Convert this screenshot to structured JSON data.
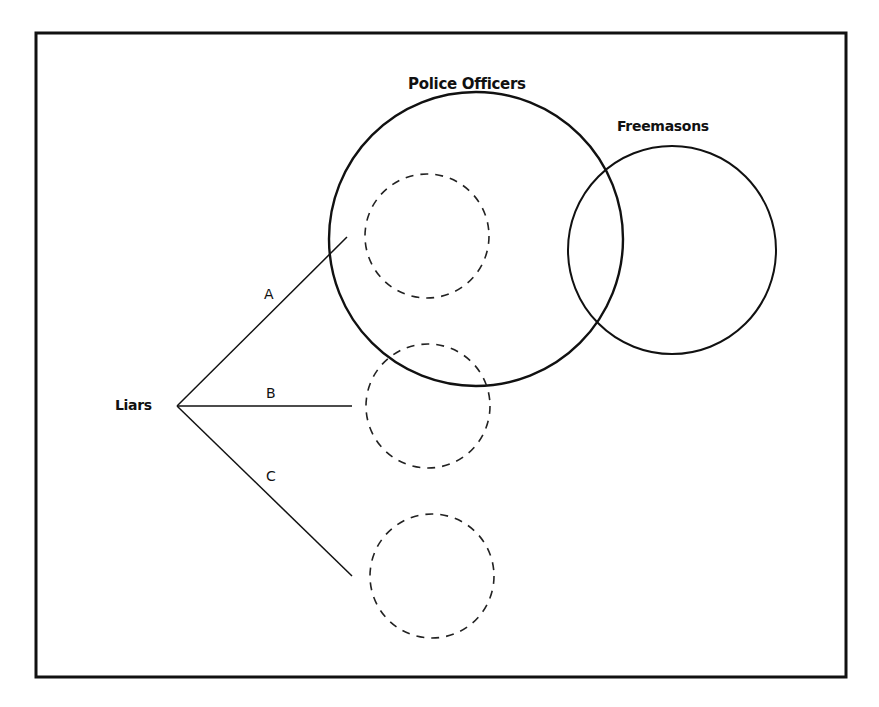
{
  "diagram": {
    "type": "venn-with-branches",
    "frame": {
      "x": 36,
      "y": 33,
      "width": 810,
      "height": 644,
      "stroke": "#111111"
    },
    "sets": [
      {
        "id": "police",
        "label": "Police Officers",
        "cx": 476,
        "cy": 239,
        "r": 147,
        "style": "solid"
      },
      {
        "id": "freemasons",
        "label": "Freemasons",
        "cx": 672,
        "cy": 250,
        "r": 104,
        "style": "solid"
      }
    ],
    "hypothetical_sets": [
      {
        "id": "liars-a",
        "cx": 427,
        "cy": 236,
        "r": 62,
        "style": "dashed"
      },
      {
        "id": "liars-b",
        "cx": 428,
        "cy": 406,
        "r": 62,
        "style": "dashed"
      },
      {
        "id": "liars-c",
        "cx": 432,
        "cy": 576,
        "r": 62,
        "style": "dashed"
      }
    ],
    "origin": {
      "label": "Liars",
      "x": 177,
      "y": 406
    },
    "branches": [
      {
        "label": "A",
        "x2": 347,
        "y2": 237
      },
      {
        "label": "B",
        "x2": 352,
        "y2": 406
      },
      {
        "label": "C",
        "x2": 352,
        "y2": 576
      }
    ]
  },
  "labels": {
    "police": "Police Officers",
    "freemasons": "Freemasons",
    "liars": "Liars",
    "branch_a": "A",
    "branch_b": "B",
    "branch_c": "C"
  }
}
